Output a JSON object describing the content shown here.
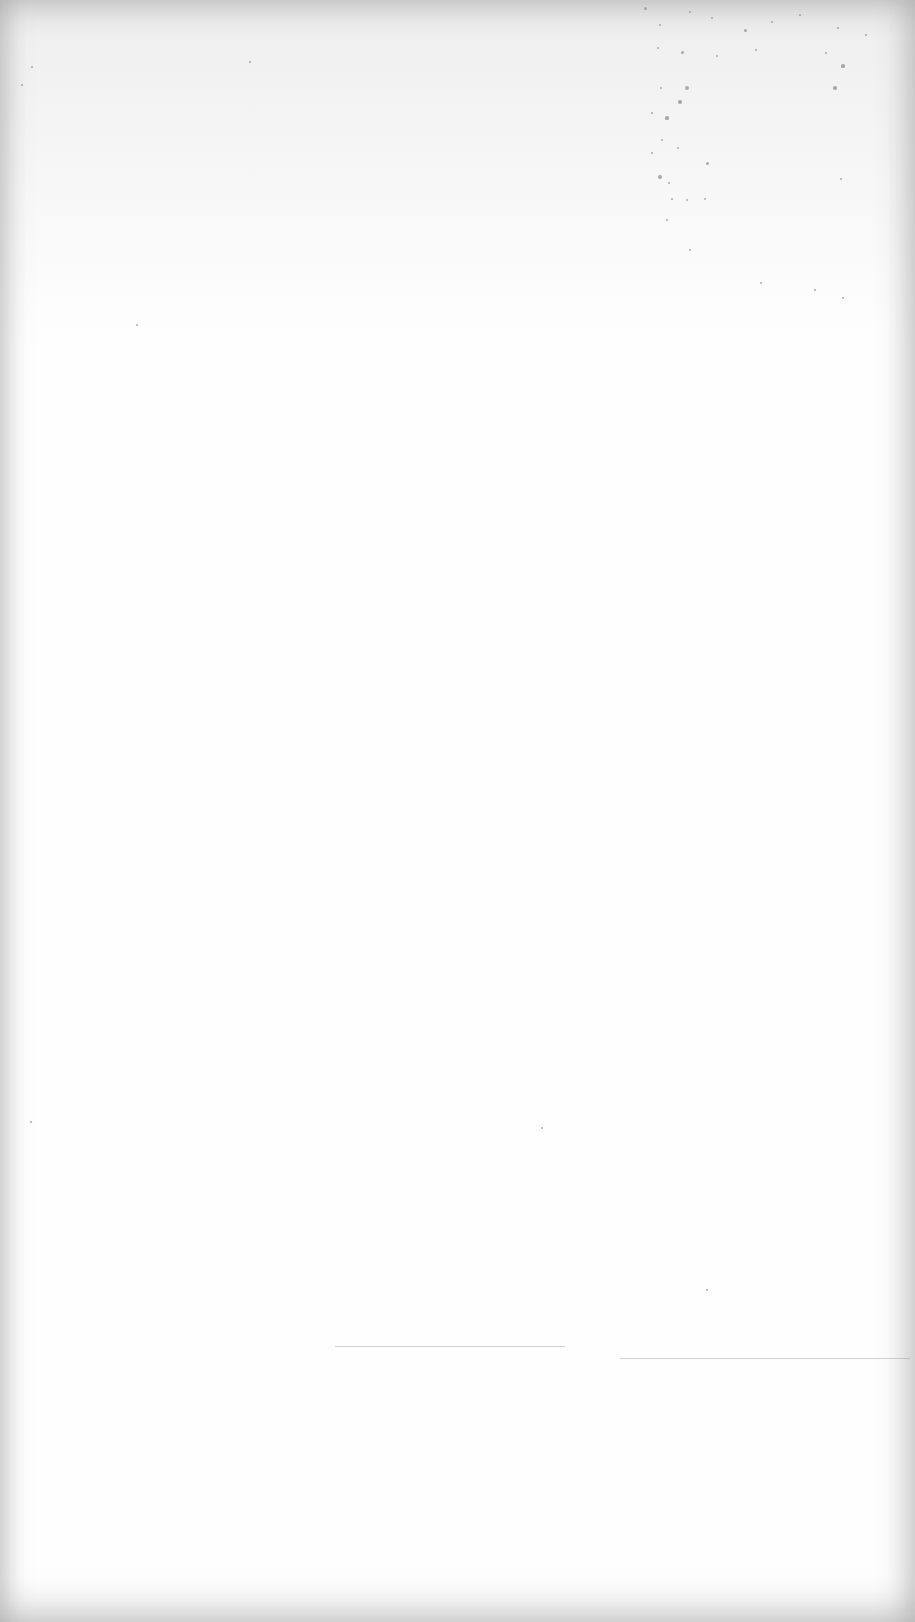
{
  "document": {
    "type": "blank scanned page",
    "text": "",
    "background_color": "#fefefe",
    "edge_shadow_color": "#969696",
    "speckle_color": "#8a8a8a"
  },
  "specks": [
    {
      "x": 645,
      "y": 8,
      "r": 1.5
    },
    {
      "x": 660,
      "y": 25,
      "r": 1.2
    },
    {
      "x": 690,
      "y": 12,
      "r": 1.0
    },
    {
      "x": 712,
      "y": 18,
      "r": 1.3
    },
    {
      "x": 745,
      "y": 30,
      "r": 1.5
    },
    {
      "x": 772,
      "y": 22,
      "r": 1.2
    },
    {
      "x": 800,
      "y": 15,
      "r": 1.0
    },
    {
      "x": 838,
      "y": 28,
      "r": 1.4
    },
    {
      "x": 866,
      "y": 35,
      "r": 1.2
    },
    {
      "x": 658,
      "y": 48,
      "r": 1.3
    },
    {
      "x": 682,
      "y": 52,
      "r": 1.5
    },
    {
      "x": 717,
      "y": 56,
      "r": 1.2
    },
    {
      "x": 756,
      "y": 50,
      "r": 1.0
    },
    {
      "x": 826,
      "y": 53,
      "r": 1.1
    },
    {
      "x": 843,
      "y": 66,
      "r": 1.6
    },
    {
      "x": 687,
      "y": 88,
      "r": 2.0
    },
    {
      "x": 661,
      "y": 88,
      "r": 1.3
    },
    {
      "x": 835,
      "y": 88,
      "r": 1.8
    },
    {
      "x": 680,
      "y": 102,
      "r": 1.8
    },
    {
      "x": 652,
      "y": 113,
      "r": 1.2
    },
    {
      "x": 667,
      "y": 118,
      "r": 1.6
    },
    {
      "x": 662,
      "y": 140,
      "r": 1.3
    },
    {
      "x": 678,
      "y": 148,
      "r": 1.4
    },
    {
      "x": 707,
      "y": 163,
      "r": 1.5
    },
    {
      "x": 652,
      "y": 153,
      "r": 1.1
    },
    {
      "x": 660,
      "y": 177,
      "r": 1.8
    },
    {
      "x": 669,
      "y": 183,
      "r": 1.2
    },
    {
      "x": 672,
      "y": 199,
      "r": 1.4
    },
    {
      "x": 687,
      "y": 200,
      "r": 1.3
    },
    {
      "x": 705,
      "y": 199,
      "r": 1.4
    },
    {
      "x": 841,
      "y": 179,
      "r": 1.4
    },
    {
      "x": 667,
      "y": 220,
      "r": 1.2
    },
    {
      "x": 690,
      "y": 250,
      "r": 1.1
    },
    {
      "x": 761,
      "y": 283,
      "r": 1.2
    },
    {
      "x": 843,
      "y": 298,
      "r": 1.3
    },
    {
      "x": 815,
      "y": 290,
      "r": 1.0
    }
  ],
  "stray_marks": [
    {
      "x": 22,
      "y": 85,
      "r": 1.3
    },
    {
      "x": 32,
      "y": 67,
      "r": 1.0
    },
    {
      "x": 250,
      "y": 62,
      "r": 1.2
    },
    {
      "x": 137,
      "y": 325,
      "r": 1.0
    },
    {
      "x": 542,
      "y": 1128,
      "r": 1.1
    },
    {
      "x": 707,
      "y": 1290,
      "r": 1.0
    },
    {
      "x": 31,
      "y": 1122,
      "r": 1.0
    }
  ],
  "scan_lines": [
    {
      "x": 335,
      "y": 1346,
      "w": 230
    },
    {
      "x": 620,
      "y": 1358,
      "w": 290
    }
  ]
}
